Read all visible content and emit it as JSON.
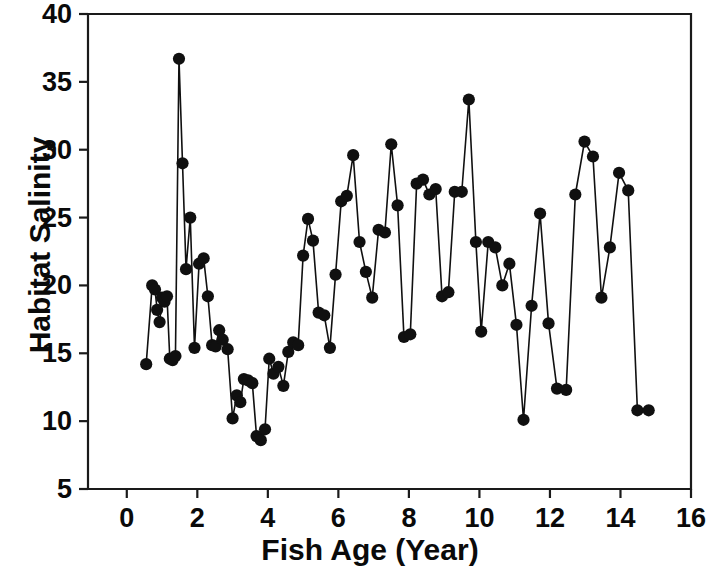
{
  "chart_data": {
    "type": "scatter",
    "title": "",
    "xlabel": "Fish Age (Year)",
    "ylabel": "Habitat Salinity",
    "xlim": [
      -1.1,
      16
    ],
    "ylim": [
      5,
      40
    ],
    "xticks": [
      0,
      2,
      4,
      6,
      8,
      10,
      12,
      14,
      16
    ],
    "xtick_labels": [
      "0",
      "2",
      "4",
      "6",
      "8",
      "10",
      "12",
      "14",
      "16"
    ],
    "yticks": [
      5,
      10,
      15,
      20,
      25,
      30,
      35,
      40
    ],
    "ytick_labels": [
      "5",
      "10",
      "15",
      "20",
      "25",
      "30",
      "35",
      "40"
    ],
    "grid": false,
    "legend": null,
    "marker": "filled-circle",
    "marker_color": "#101010",
    "line_color": "#101010",
    "series": [
      {
        "name": "Habitat Salinity",
        "x": [
          0.55,
          0.72,
          0.8,
          0.86,
          0.93,
          1.0,
          1.07,
          1.14,
          1.22,
          1.3,
          1.38,
          1.48,
          1.58,
          1.68,
          1.8,
          1.92,
          2.05,
          2.18,
          2.3,
          2.42,
          2.52,
          2.62,
          2.72,
          2.86,
          3.0,
          3.12,
          3.22,
          3.32,
          3.44,
          3.56,
          3.68,
          3.8,
          3.92,
          4.04,
          4.16,
          4.3,
          4.44,
          4.58,
          4.72,
          4.86,
          5.0,
          5.14,
          5.28,
          5.44,
          5.6,
          5.76,
          5.92,
          6.08,
          6.24,
          6.42,
          6.6,
          6.78,
          6.96,
          7.14,
          7.32,
          7.5,
          7.68,
          7.86,
          8.04,
          8.22,
          8.4,
          8.58,
          8.76,
          8.94,
          9.12,
          9.3,
          9.5,
          9.7,
          9.9,
          10.05,
          10.25,
          10.45,
          10.65,
          10.85,
          11.05,
          11.25,
          11.48,
          11.72,
          11.96,
          12.2,
          12.46,
          12.72,
          12.98,
          13.22,
          13.46,
          13.7,
          13.96,
          14.22,
          14.48,
          14.8
        ],
        "y": [
          14.2,
          20.0,
          19.7,
          18.2,
          17.3,
          19.1,
          18.8,
          19.2,
          14.6,
          14.5,
          14.8,
          36.7,
          29.0,
          21.2,
          25.0,
          15.4,
          21.6,
          22.0,
          19.2,
          15.6,
          15.5,
          16.7,
          16.0,
          15.3,
          10.2,
          11.9,
          11.4,
          13.1,
          13.0,
          12.8,
          8.9,
          8.6,
          9.4,
          14.6,
          13.5,
          14.0,
          12.6,
          15.1,
          15.8,
          15.6,
          22.2,
          24.9,
          23.3,
          18.0,
          17.8,
          15.4,
          20.8,
          26.2,
          26.6,
          29.6,
          23.2,
          21.0,
          19.1,
          24.1,
          23.9,
          30.4,
          25.9,
          16.2,
          16.4,
          27.5,
          27.8,
          26.7,
          27.1,
          19.2,
          19.5,
          26.9,
          26.9,
          33.7,
          23.2,
          16.6,
          23.2,
          22.8,
          20.0,
          21.6,
          17.1,
          10.1,
          18.5,
          25.3,
          17.2,
          12.4,
          12.3,
          26.7,
          30.6,
          29.5,
          19.1,
          22.8,
          28.3,
          27.0,
          10.8,
          10.8
        ]
      }
    ]
  },
  "axes": {
    "x_title": "Fish Age (Year)",
    "y_title": "Habitat Salinity"
  }
}
